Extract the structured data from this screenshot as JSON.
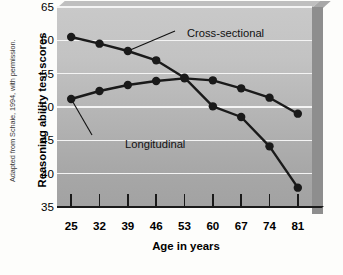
{
  "credit": "Adapted from Schaie, 1994, with permission.",
  "chart_data": {
    "type": "line",
    "title": "",
    "xlabel": "Age in years",
    "ylabel": "Reasoning ability test scores",
    "x": [
      25,
      32,
      39,
      46,
      53,
      60,
      67,
      74,
      81
    ],
    "xtick_labels": [
      "25",
      "32",
      "39",
      "46",
      "53",
      "60",
      "67",
      "74",
      "81"
    ],
    "ytick_labels": [
      "65",
      "60",
      "55",
      "50",
      "45",
      "40",
      "35"
    ],
    "yticks": [
      65,
      60,
      55,
      50,
      45,
      40,
      35
    ],
    "ylim": [
      35,
      65
    ],
    "xlim": [
      25,
      81
    ],
    "grid": "horizontal",
    "legend_position": "inline-annotations",
    "marker": "filled-circle",
    "series": [
      {
        "name": "Cross-sectional",
        "color": "#1a1a1a",
        "values": [
          60.5,
          59.5,
          58.4,
          57.0,
          54.4,
          50.1,
          48.5,
          44.1,
          37.9
        ]
      },
      {
        "name": "Longitudinal",
        "color": "#1a1a1a",
        "values": [
          51.2,
          52.4,
          53.3,
          53.9,
          54.3,
          54.0,
          52.8,
          51.4,
          49.0
        ]
      }
    ],
    "annotations": [
      {
        "text": "Cross-sectional",
        "points_to_series": "Cross-sectional",
        "points_to_x": 39
      },
      {
        "text": "Longitudinal",
        "points_to_series": "Longitudinal",
        "points_to_x": 25
      }
    ]
  },
  "colors": {
    "plot_background_top": "#c9c9c9",
    "plot_background_bottom": "#a2a2a2",
    "gridline": "#f4f4f4",
    "axis": "#1a1a1a",
    "slab_side": "#8e8e8e",
    "page_background": "#fdfdfb"
  }
}
